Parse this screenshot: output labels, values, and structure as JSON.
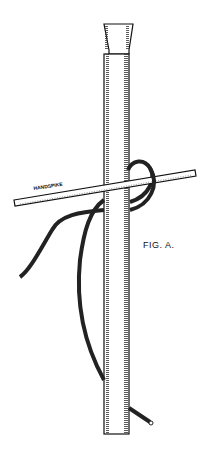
{
  "figure": {
    "caption": "FIG. A.",
    "handspike_label": "HANDSPIKE"
  }
}
